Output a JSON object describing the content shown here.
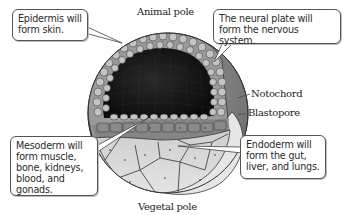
{
  "diagram": {
    "labels": {
      "animal_pole": "Animal pole",
      "vegetal_pole": "Vegetal pole",
      "notochord": "Notochord",
      "blastopore": "Blastopore"
    },
    "callouts": {
      "epidermis": {
        "lines": [
          "Epidermis will",
          "form skin."
        ]
      },
      "neural_plate": {
        "lines": [
          "The neural plate will",
          "form the nervous system."
        ]
      },
      "mesoderm": {
        "lines": [
          "Mesoderm will",
          "form muscle,",
          "bone, kidneys,",
          "blood, and",
          "gonads."
        ]
      },
      "endoderm": {
        "lines": [
          "Endoderm will",
          "form the gut,",
          "liver, and lungs."
        ]
      }
    },
    "colors": {
      "ectoderm_outer": "#7a7a7a",
      "ectoderm_cells": "#b5b5b5",
      "blastocoel": "#1a1a1a",
      "neural_plate": "#8c8c8c",
      "mesoderm": "#8e8e8e",
      "endoderm": "#d6d6d6",
      "yolk_flap": "#e6e6e6",
      "outline": "#333333"
    }
  }
}
